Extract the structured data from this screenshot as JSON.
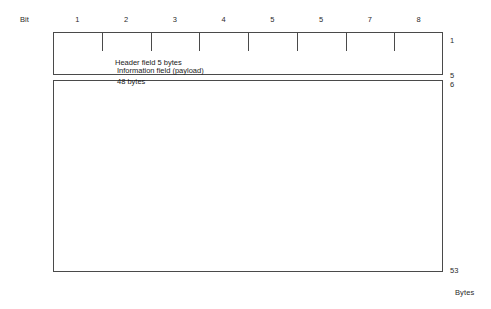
{
  "diagram": {
    "axes": {
      "bit_label": "Bit",
      "bytes_label": "Bytes"
    },
    "bit_scale": {
      "numbers": [
        "1",
        "2",
        "3",
        "4",
        "5",
        "5",
        "7",
        "8"
      ],
      "tick_count": 7
    },
    "fields": [
      {
        "name": "header",
        "label": "Header field   5 bytes",
        "title": "Header field",
        "size": "5 bytes"
      },
      {
        "name": "information",
        "label": "Information field (payload)\n48 bytes",
        "title": "Information field (payload)",
        "size": "48 bytes"
      }
    ],
    "byte_markers": {
      "start": "1",
      "header_end": "5",
      "payload_start": "6",
      "end": "53"
    },
    "colors": {
      "line": "#4a4a4a",
      "text": "#1a1a1a",
      "background": "#ffffff"
    }
  }
}
